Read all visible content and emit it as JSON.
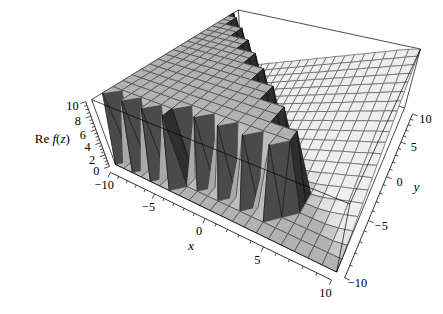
{
  "figure": {
    "width": 443,
    "height": 314,
    "background": "#ffffff"
  },
  "chart_data": {
    "type": "surface",
    "title": "",
    "axes": {
      "x": {
        "range": [
          -10,
          10
        ],
        "major_ticks": [
          -10,
          -5,
          0,
          5,
          10
        ],
        "tick_labels": [
          "−10",
          "−5",
          "0",
          "5",
          "10"
        ],
        "minor_step": 1,
        "title": "x"
      },
      "y": {
        "range": [
          -10,
          10
        ],
        "major_ticks": [
          -10,
          -5,
          0,
          5,
          10
        ],
        "tick_labels": [
          "−10",
          "−5",
          "0",
          "5",
          "10"
        ],
        "minor_step": 1,
        "title": "y"
      },
      "z": {
        "range": [
          0,
          10
        ],
        "major_ticks": [
          0,
          2,
          4,
          6,
          8,
          10
        ],
        "tick_labels": [
          "0",
          "2",
          "4",
          "6",
          "8",
          "10"
        ],
        "minor_step": 0.5,
        "title": "Re f(z)",
        "title_parts": [
          {
            "t": "Re ",
            "i": false
          },
          {
            "t": "f",
            "i": true
          },
          {
            "t": "(",
            "i": false
          },
          {
            "t": "z",
            "i": true
          },
          {
            "t": ")",
            "i": false
          }
        ]
      }
    },
    "grid_size": 21,
    "values": [
      [
        0,
        0,
        0,
        0,
        0,
        0,
        0,
        0,
        0,
        0,
        0,
        0,
        0,
        0,
        0,
        0,
        0,
        0,
        0,
        0,
        0
      ],
      [
        10,
        0,
        10,
        0,
        10,
        0,
        10,
        0,
        0,
        0,
        0,
        0,
        0,
        0,
        0,
        0,
        0,
        0,
        0,
        0,
        0
      ],
      [
        10,
        10,
        10,
        10,
        10,
        10,
        10,
        0,
        10,
        0,
        10,
        0,
        10,
        0,
        10,
        0,
        0,
        0,
        0,
        0,
        0.3
      ],
      [
        10,
        10,
        10,
        10,
        10,
        10,
        10,
        10,
        10,
        10,
        10,
        10,
        10,
        10,
        10,
        10,
        0,
        0,
        0,
        0.3,
        0.8
      ],
      [
        10,
        10,
        10,
        10,
        10,
        10,
        10,
        10,
        10,
        10,
        10,
        10,
        10,
        10,
        10,
        10,
        0,
        0,
        0.3,
        0.8,
        1.4
      ],
      [
        10,
        10,
        10,
        10,
        10,
        10,
        10,
        10,
        10,
        10,
        10,
        10,
        10,
        10,
        0,
        0,
        0,
        0.3,
        0.8,
        1.4,
        1.9
      ],
      [
        10,
        10,
        10,
        10,
        10,
        10,
        10,
        10,
        10,
        10,
        10,
        10,
        10,
        10,
        0,
        0,
        0.3,
        0.8,
        1.4,
        1.9,
        2.5
      ],
      [
        10,
        10,
        10,
        10,
        10,
        10,
        10,
        10,
        10,
        10,
        10,
        10,
        0,
        0,
        0,
        0.3,
        0.8,
        1.4,
        1.9,
        2.5,
        3
      ],
      [
        10,
        10,
        10,
        10,
        10,
        10,
        10,
        10,
        10,
        10,
        10,
        10,
        0,
        0,
        0.3,
        0.8,
        1.4,
        1.9,
        2.5,
        3,
        3.6
      ],
      [
        10,
        10,
        10,
        10,
        10,
        10,
        10,
        10,
        10,
        10,
        0,
        0,
        0,
        0.3,
        0.8,
        1.4,
        1.9,
        2.5,
        3,
        3.6,
        4.1
      ],
      [
        10,
        10,
        10,
        10,
        10,
        10,
        10,
        10,
        10,
        10,
        0,
        0,
        0.3,
        0.8,
        1.4,
        1.9,
        2.5,
        3,
        3.6,
        4.1,
        4.7
      ],
      [
        10,
        10,
        10,
        10,
        10,
        10,
        10,
        10,
        0,
        0,
        0,
        0.3,
        0.8,
        1.4,
        1.9,
        2.5,
        3,
        3.6,
        4.1,
        4.7,
        5.2
      ],
      [
        10,
        10,
        10,
        10,
        10,
        10,
        10,
        10,
        0,
        0,
        0.3,
        0.8,
        1.4,
        1.9,
        2.5,
        3,
        3.6,
        4.1,
        4.7,
        5.2,
        5.8
      ],
      [
        10,
        10,
        10,
        10,
        10,
        10,
        0,
        0,
        0,
        0.3,
        0.8,
        1.4,
        1.9,
        2.5,
        3,
        3.6,
        4.1,
        4.7,
        5.2,
        5.8,
        6.3
      ],
      [
        10,
        10,
        10,
        10,
        10,
        10,
        0,
        0,
        0.3,
        0.8,
        1.4,
        1.9,
        2.5,
        3,
        3.6,
        4.1,
        4.7,
        5.2,
        5.8,
        6.3,
        6.9
      ],
      [
        10,
        10,
        10,
        10,
        0,
        0,
        0,
        0.3,
        0.8,
        1.4,
        1.9,
        2.5,
        3,
        3.6,
        4.1,
        4.7,
        5.2,
        5.8,
        6.3,
        6.9,
        7.4
      ],
      [
        10,
        10,
        10,
        10,
        0,
        0,
        0.3,
        0.8,
        1.4,
        1.9,
        2.5,
        3,
        3.6,
        4.1,
        4.7,
        5.2,
        5.8,
        6.3,
        6.9,
        7.4,
        8
      ],
      [
        10,
        10,
        0,
        0,
        0,
        0.3,
        0.8,
        1.4,
        1.9,
        2.5,
        3,
        3.6,
        4.1,
        4.7,
        5.2,
        5.8,
        6.3,
        6.9,
        7.4,
        8,
        8.5
      ],
      [
        10,
        10,
        0,
        0,
        0.3,
        0.8,
        1.4,
        1.9,
        2.5,
        3,
        3.6,
        4.1,
        4.7,
        5.2,
        5.8,
        6.3,
        6.9,
        7.4,
        8,
        8.5,
        9.1
      ],
      [
        10,
        0,
        0,
        0.3,
        0.8,
        1.4,
        1.9,
        2.5,
        3,
        3.6,
        4.1,
        4.7,
        5.2,
        5.8,
        6.3,
        6.9,
        7.4,
        8,
        8.5,
        9.1,
        9.6
      ],
      [
        0,
        0,
        0.3,
        0.8,
        1.4,
        1.9,
        2.5,
        3,
        3.6,
        4.1,
        4.7,
        5.2,
        5.8,
        6.3,
        6.9,
        7.4,
        8,
        8.5,
        9.1,
        9.6,
        10
      ]
    ],
    "view": {
      "viewpoint": [
        1.3,
        -2.4,
        2.0
      ],
      "distance": 3.2,
      "box_z_ratio": 0.68
    },
    "style": {
      "mesh": "#000000",
      "background": "#ffffff",
      "light_dir": [
        -0.5,
        -0.6,
        0.64
      ],
      "ambient": 0.18,
      "diffuse": 0.82
    }
  }
}
